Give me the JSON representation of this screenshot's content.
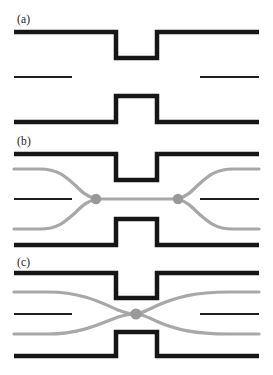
{
  "figure": {
    "width": 273,
    "height": 375,
    "background": "#ffffff"
  },
  "colors": {
    "wall": "#161616",
    "streamline_dark": "#1f1f1f",
    "streamline_gray": "#a8a8a8",
    "stagnation_point": "#999999",
    "label_text": "#1a1a1a",
    "background": "#ffffff"
  },
  "geometry": {
    "channel_left": 14,
    "channel_right": 259,
    "notch_left": 116,
    "notch_right": 157,
    "wall_thickness": 4.5,
    "streamline_thickness_gray": 3.2,
    "streamline_thickness_dark": 2.0,
    "stagnation_radius": 5.2
  },
  "panels": [
    {
      "id": "a",
      "label": "(a)",
      "label_x": 17,
      "label_y": 14,
      "top_wall_y": 32,
      "bottom_wall_y": 122,
      "notch_top_inner_y": 58,
      "notch_bottom_inner_y": 96,
      "center_y": 77,
      "streamlines": [
        {
          "name": "center-left-segment",
          "color": "dark",
          "x_start": 14,
          "x_end": 72,
          "y": 77
        },
        {
          "name": "center-right-segment",
          "color": "dark",
          "x_start": 200,
          "x_end": 259,
          "y": 77
        }
      ],
      "stagnation_points": [],
      "caption_meaning": "No flow separatrix drawn; bare constricted channel geometry"
    },
    {
      "id": "b",
      "label": "(b)",
      "label_x": 17,
      "label_y": 136,
      "top_wall_y": 154,
      "bottom_wall_y": 245,
      "notch_top_inner_y": 180,
      "notch_bottom_inner_y": 219,
      "center_y": 199,
      "streamlines": [
        {
          "name": "upper-gray-separatrix",
          "color": "gray",
          "shape": "fan-in-from-left-top"
        },
        {
          "name": "lower-gray-separatrix",
          "color": "gray",
          "shape": "fan-in-from-left-bottom"
        },
        {
          "name": "upper-gray-separatrix-right",
          "color": "gray",
          "shape": "fan-out-to-right-top"
        },
        {
          "name": "lower-gray-separatrix-right",
          "color": "gray",
          "shape": "fan-out-to-right-bottom"
        },
        {
          "name": "center-gray-connector",
          "color": "gray",
          "x_start": 96,
          "x_end": 178,
          "y": 199
        },
        {
          "name": "center-left-dark-segment",
          "color": "dark",
          "x_start": 14,
          "x_end": 72,
          "y": 199
        },
        {
          "name": "center-right-dark-segment",
          "color": "dark",
          "x_start": 200,
          "x_end": 259,
          "y": 199
        }
      ],
      "stagnation_points": [
        {
          "name": "left-stagnation-point",
          "x": 96,
          "y": 199
        },
        {
          "name": "right-stagnation-point",
          "x": 178,
          "y": 199
        }
      ],
      "caption_meaning": "Two stagnation points joined by a straight separatrix segment through the constriction"
    },
    {
      "id": "c",
      "label": "(c)",
      "label_x": 17,
      "label_y": 257,
      "top_wall_y": 273,
      "bottom_wall_y": 356,
      "notch_top_inner_y": 297,
      "notch_bottom_inner_y": 332,
      "center_y": 314,
      "streamlines": [
        {
          "name": "descending-gray-separatrix",
          "color": "gray",
          "shape": "top-left-to-bottom-right"
        },
        {
          "name": "ascending-gray-separatrix",
          "color": "gray",
          "shape": "bottom-left-to-top-right"
        },
        {
          "name": "center-left-dark-segment",
          "color": "dark",
          "x_start": 14,
          "x_end": 72,
          "y": 314
        },
        {
          "name": "center-right-dark-segment",
          "color": "dark",
          "x_start": 200,
          "x_end": 259,
          "y": 314
        }
      ],
      "stagnation_points": [
        {
          "name": "center-crossing-point",
          "x": 136,
          "y": 314
        }
      ],
      "caption_meaning": "Single hyperbolic crossing point at the centre of the constriction"
    }
  ]
}
